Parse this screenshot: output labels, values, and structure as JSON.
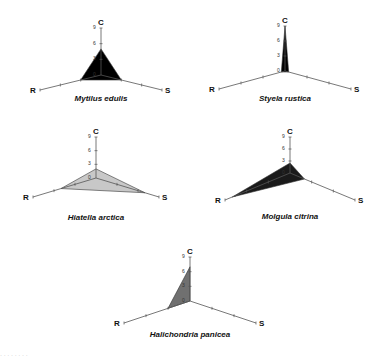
{
  "chart_data": {
    "type": "radar",
    "axes": [
      "C",
      "S",
      "R"
    ],
    "axis_range": [
      0,
      9
    ],
    "ticks": [
      0,
      3,
      6,
      9
    ],
    "grid": false,
    "legend": null,
    "charts": [
      {
        "title": "Mytilus edulis",
        "values": {
          "C": 5,
          "S": 3,
          "R": 3
        },
        "fill": "#000000"
      },
      {
        "title": "Styela rustica",
        "values": {
          "C": 9,
          "S": 0.5,
          "R": 0.5
        },
        "fill": "#000000"
      },
      {
        "title": "Hiatella arctica",
        "values": {
          "C": 2,
          "S": 7,
          "R": 5
        },
        "fill": "#c8c8c8"
      },
      {
        "title": "Molgula citrina",
        "values": {
          "C": 2.5,
          "S": 2,
          "R": 8
        },
        "fill": "#1a1a1a"
      },
      {
        "title": "Halichondria panicea",
        "values": {
          "C": 7,
          "S": 0,
          "R": 3
        },
        "fill": "#707070"
      }
    ]
  },
  "panels": [
    {
      "id": "mytilus",
      "title": "Mytilus edulis",
      "cx": 101,
      "cy": 75,
      "c_len": 47,
      "rx": 61,
      "ry": 15,
      "label_y": 99
    },
    {
      "id": "styela",
      "title": "Styela rustica",
      "cx": 285,
      "cy": 71,
      "c_len": 45,
      "rx": 66,
      "ry": 18,
      "label_y": 99
    },
    {
      "id": "hiatella",
      "title": "Hiatella arctica",
      "cx": 96,
      "cy": 178,
      "c_len": 41,
      "rx": 63,
      "ry": 19,
      "label_y": 218
    },
    {
      "id": "molgula",
      "title": "Molgula citrina",
      "cx": 290,
      "cy": 173,
      "c_len": 36,
      "rx": 65,
      "ry": 27,
      "label_y": 217
    },
    {
      "id": "halichondria",
      "title": "Halichondria panicea",
      "cx": 190,
      "cy": 301,
      "c_len": 44,
      "rx": 66,
      "ry": 22,
      "label_y": 335
    }
  ],
  "footer": {
    "text": "· · · · · · · ·"
  }
}
